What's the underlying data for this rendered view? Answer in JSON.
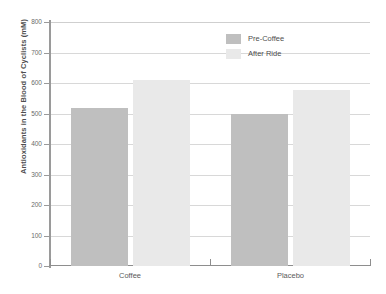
{
  "chart_data": {
    "type": "bar",
    "title": "",
    "subtitle": "",
    "xlabel": "",
    "ylabel": "Antioxidants in the Blood of Cyclists (mM)",
    "categories": [
      "Coffee",
      "Placebo"
    ],
    "series": [
      {
        "name": "Pre-Coffee",
        "color": "#bfbfbf",
        "values": [
          518,
          498
        ]
      },
      {
        "name": "After Ride",
        "color": "#e9e9e9",
        "values": [
          611,
          577
        ]
      }
    ],
    "ylim": [
      0,
      800
    ],
    "ytick_step": 100,
    "yticks": [
      0,
      100,
      200,
      300,
      400,
      500,
      600,
      700,
      800
    ],
    "ytick_labels": [
      "0",
      "100",
      "200",
      "300",
      "400",
      "500",
      "600",
      "700",
      "800"
    ],
    "grid": true,
    "grid_axis": "y",
    "legend_position": "top-right",
    "annotations": []
  },
  "legend": {
    "entries": [
      {
        "label": "Pre-Coffee"
      },
      {
        "label": "After Ride"
      }
    ]
  },
  "axes": {
    "y_title": "Antioxidants in the Blood of Cyclists (mM)"
  }
}
